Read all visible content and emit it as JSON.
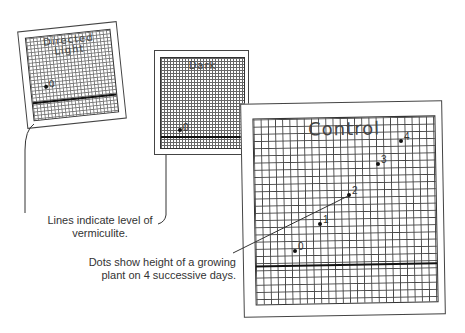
{
  "cards": {
    "directed": {
      "title_line1": "Directed",
      "title_line2": "Light",
      "point_label": "0"
    },
    "dark": {
      "title": "Dark",
      "point_label": "0"
    },
    "control": {
      "title": "Control",
      "points": [
        {
          "label": "0",
          "x": 295,
          "y": 251
        },
        {
          "label": "1",
          "x": 320,
          "y": 224
        },
        {
          "label": "2",
          "x": 349,
          "y": 195
        },
        {
          "label": "3",
          "x": 378,
          "y": 164
        },
        {
          "label": "4",
          "x": 401,
          "y": 141
        }
      ]
    }
  },
  "captions": {
    "vermiculite": [
      "Lines indicate level of",
      "vermiculite."
    ],
    "dots": [
      "Dots show height of a growing",
      "plant on 4 successive days."
    ]
  }
}
